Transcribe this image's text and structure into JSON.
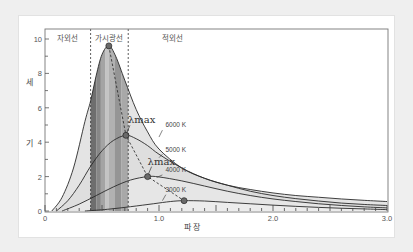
{
  "chart_data": {
    "type": "line",
    "title": "",
    "xlabel": "파 장",
    "ylabel_chars": [
      "세",
      "기"
    ],
    "xlim": [
      0,
      3.0
    ],
    "ylim": [
      0,
      10.4
    ],
    "x_ticks": [
      {
        "value": 0,
        "label": "0"
      },
      {
        "value": 1.0,
        "label": "1.0"
      },
      {
        "value": 2.0,
        "label": "2.0"
      },
      {
        "value": 3.0,
        "label": "3.0"
      }
    ],
    "y_ticks": [
      {
        "value": 0,
        "label": "0"
      },
      {
        "value": 2,
        "label": "2"
      },
      {
        "value": 4,
        "label": "4"
      },
      {
        "value": 6,
        "label": "6"
      },
      {
        "value": 8,
        "label": "8"
      },
      {
        "value": 10,
        "label": "10"
      }
    ],
    "grid": false,
    "regions": [
      {
        "name": "자외선",
        "x_from": 0,
        "x_to": 0.4
      },
      {
        "name": "가시광선",
        "x_from": 0.4,
        "x_to": 0.73
      },
      {
        "name": "적외선",
        "x_from": 0.73,
        "x_to": 3.0
      }
    ],
    "visible_bands": [
      {
        "x_from": 0.4,
        "x_to": 0.45,
        "color": "#6e6e6e"
      },
      {
        "x_from": 0.45,
        "x_to": 0.49,
        "color": "#878787"
      },
      {
        "x_from": 0.49,
        "x_to": 0.53,
        "color": "#a4a4a4"
      },
      {
        "x_from": 0.53,
        "x_to": 0.56,
        "color": "#c4c4c4"
      },
      {
        "x_from": 0.56,
        "x_to": 0.61,
        "color": "#b1b1b1"
      },
      {
        "x_from": 0.61,
        "x_to": 0.67,
        "color": "#959595"
      },
      {
        "x_from": 0.67,
        "x_to": 0.73,
        "color": "#a8a8a8"
      }
    ],
    "series": [
      {
        "name": "6000 K",
        "peak_x": 0.56,
        "peak_y": 9.6,
        "points": [
          [
            0.06,
            0
          ],
          [
            0.15,
            0.8
          ],
          [
            0.25,
            2.5
          ],
          [
            0.35,
            5.2
          ],
          [
            0.4,
            6.4
          ],
          [
            0.45,
            7.9
          ],
          [
            0.5,
            9.1
          ],
          [
            0.56,
            9.6
          ],
          [
            0.62,
            9.0
          ],
          [
            0.7,
            7.6
          ],
          [
            0.8,
            5.9
          ],
          [
            0.9,
            4.6
          ],
          [
            1.0,
            3.6
          ],
          [
            1.2,
            2.5
          ],
          [
            1.4,
            1.9
          ],
          [
            1.6,
            1.5
          ],
          [
            1.8,
            1.25
          ],
          [
            2.0,
            1.05
          ],
          [
            2.2,
            0.9
          ],
          [
            2.4,
            0.8
          ],
          [
            2.6,
            0.7
          ],
          [
            2.8,
            0.62
          ],
          [
            3.0,
            0.55
          ]
        ]
      },
      {
        "name": "5000 K",
        "peak_x": 0.71,
        "peak_y": 4.4,
        "points": [
          [
            0.1,
            0
          ],
          [
            0.2,
            0.6
          ],
          [
            0.3,
            1.5
          ],
          [
            0.4,
            2.6
          ],
          [
            0.5,
            3.5
          ],
          [
            0.6,
            4.1
          ],
          [
            0.71,
            4.4
          ],
          [
            0.8,
            4.2
          ],
          [
            0.9,
            3.8
          ],
          [
            1.0,
            3.3
          ],
          [
            1.2,
            2.5
          ],
          [
            1.4,
            1.9
          ],
          [
            1.6,
            1.5
          ],
          [
            1.8,
            1.15
          ],
          [
            2.0,
            0.9
          ],
          [
            2.2,
            0.72
          ],
          [
            2.4,
            0.58
          ],
          [
            2.6,
            0.46
          ],
          [
            2.8,
            0.38
          ],
          [
            3.0,
            0.32
          ]
        ]
      },
      {
        "name": "4000 K",
        "peak_x": 0.9,
        "peak_y": 2.0,
        "points": [
          [
            0.15,
            0
          ],
          [
            0.3,
            0.4
          ],
          [
            0.45,
            0.9
          ],
          [
            0.6,
            1.4
          ],
          [
            0.75,
            1.8
          ],
          [
            0.9,
            2.0
          ],
          [
            1.0,
            1.98
          ],
          [
            1.2,
            1.75
          ],
          [
            1.4,
            1.45
          ],
          [
            1.6,
            1.15
          ],
          [
            1.8,
            0.9
          ],
          [
            2.0,
            0.7
          ],
          [
            2.2,
            0.55
          ],
          [
            2.4,
            0.42
          ],
          [
            2.6,
            0.32
          ],
          [
            2.8,
            0.24
          ],
          [
            3.0,
            0.18
          ]
        ]
      },
      {
        "name": "3000 K",
        "peak_x": 1.22,
        "peak_y": 0.6,
        "points": [
          [
            0.35,
            0
          ],
          [
            0.55,
            0.1
          ],
          [
            0.75,
            0.25
          ],
          [
            0.95,
            0.42
          ],
          [
            1.1,
            0.55
          ],
          [
            1.22,
            0.6
          ],
          [
            1.4,
            0.58
          ],
          [
            1.6,
            0.5
          ],
          [
            1.8,
            0.42
          ],
          [
            2.0,
            0.34
          ],
          [
            2.2,
            0.27
          ],
          [
            2.4,
            0.21
          ],
          [
            2.6,
            0.16
          ],
          [
            2.8,
            0.12
          ],
          [
            3.0,
            0.08
          ]
        ]
      }
    ],
    "annotations": [
      {
        "text": "λmax",
        "x": 0.71,
        "y": 4.4,
        "label_dx": 0,
        "label_dy": -14
      },
      {
        "text": "λmax",
        "x": 0.9,
        "y": 2.0,
        "label_dx": -2,
        "label_dy": -14
      }
    ],
    "wien_line": [
      [
        0.56,
        9.6
      ],
      [
        0.71,
        4.4
      ],
      [
        0.9,
        2.0
      ],
      [
        1.22,
        0.6
      ]
    ],
    "curve_labels": [
      {
        "text": "6000 K",
        "x": 1.03,
        "y": 4.9
      },
      {
        "text": "5000 K",
        "x": 1.03,
        "y": 3.45
      },
      {
        "text": "4000 K",
        "x": 1.03,
        "y": 2.25
      },
      {
        "text": "3000 K",
        "x": 1.03,
        "y": 1.1
      }
    ]
  }
}
